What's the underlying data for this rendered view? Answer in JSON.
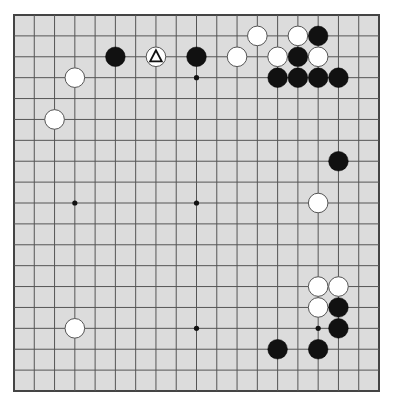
{
  "board": {
    "size": 19,
    "colors": {
      "background": "#dcdcdc",
      "line": "#555555",
      "border": "#444444",
      "black_stone": "#111111",
      "white_stone": "#ffffff",
      "star": "#111111"
    },
    "star_points": [
      [
        3,
        3
      ],
      [
        9,
        3
      ],
      [
        15,
        3
      ],
      [
        3,
        9
      ],
      [
        9,
        9
      ],
      [
        15,
        9
      ],
      [
        3,
        15
      ],
      [
        9,
        15
      ],
      [
        15,
        15
      ]
    ],
    "stones": [
      {
        "color": "black",
        "col": 5,
        "row": 2
      },
      {
        "color": "white",
        "col": 7,
        "row": 2,
        "marker": "triangle"
      },
      {
        "color": "black",
        "col": 9,
        "row": 2
      },
      {
        "color": "white",
        "col": 3,
        "row": 3
      },
      {
        "color": "white",
        "col": 2,
        "row": 5
      },
      {
        "color": "white",
        "col": 12,
        "row": 1
      },
      {
        "color": "white",
        "col": 14,
        "row": 1
      },
      {
        "color": "black",
        "col": 15,
        "row": 1
      },
      {
        "color": "white",
        "col": 11,
        "row": 2
      },
      {
        "color": "white",
        "col": 13,
        "row": 2
      },
      {
        "color": "black",
        "col": 14,
        "row": 2
      },
      {
        "color": "white",
        "col": 15,
        "row": 2
      },
      {
        "color": "black",
        "col": 13,
        "row": 3
      },
      {
        "color": "black",
        "col": 14,
        "row": 3
      },
      {
        "color": "black",
        "col": 15,
        "row": 3
      },
      {
        "color": "black",
        "col": 16,
        "row": 3
      },
      {
        "color": "black",
        "col": 16,
        "row": 7
      },
      {
        "color": "white",
        "col": 15,
        "row": 9
      },
      {
        "color": "white",
        "col": 15,
        "row": 13
      },
      {
        "color": "white",
        "col": 16,
        "row": 13
      },
      {
        "color": "white",
        "col": 15,
        "row": 14
      },
      {
        "color": "black",
        "col": 16,
        "row": 14
      },
      {
        "color": "black",
        "col": 16,
        "row": 15
      },
      {
        "color": "black",
        "col": 13,
        "row": 16
      },
      {
        "color": "black",
        "col": 15,
        "row": 16
      },
      {
        "color": "white",
        "col": 3,
        "row": 15
      }
    ]
  }
}
